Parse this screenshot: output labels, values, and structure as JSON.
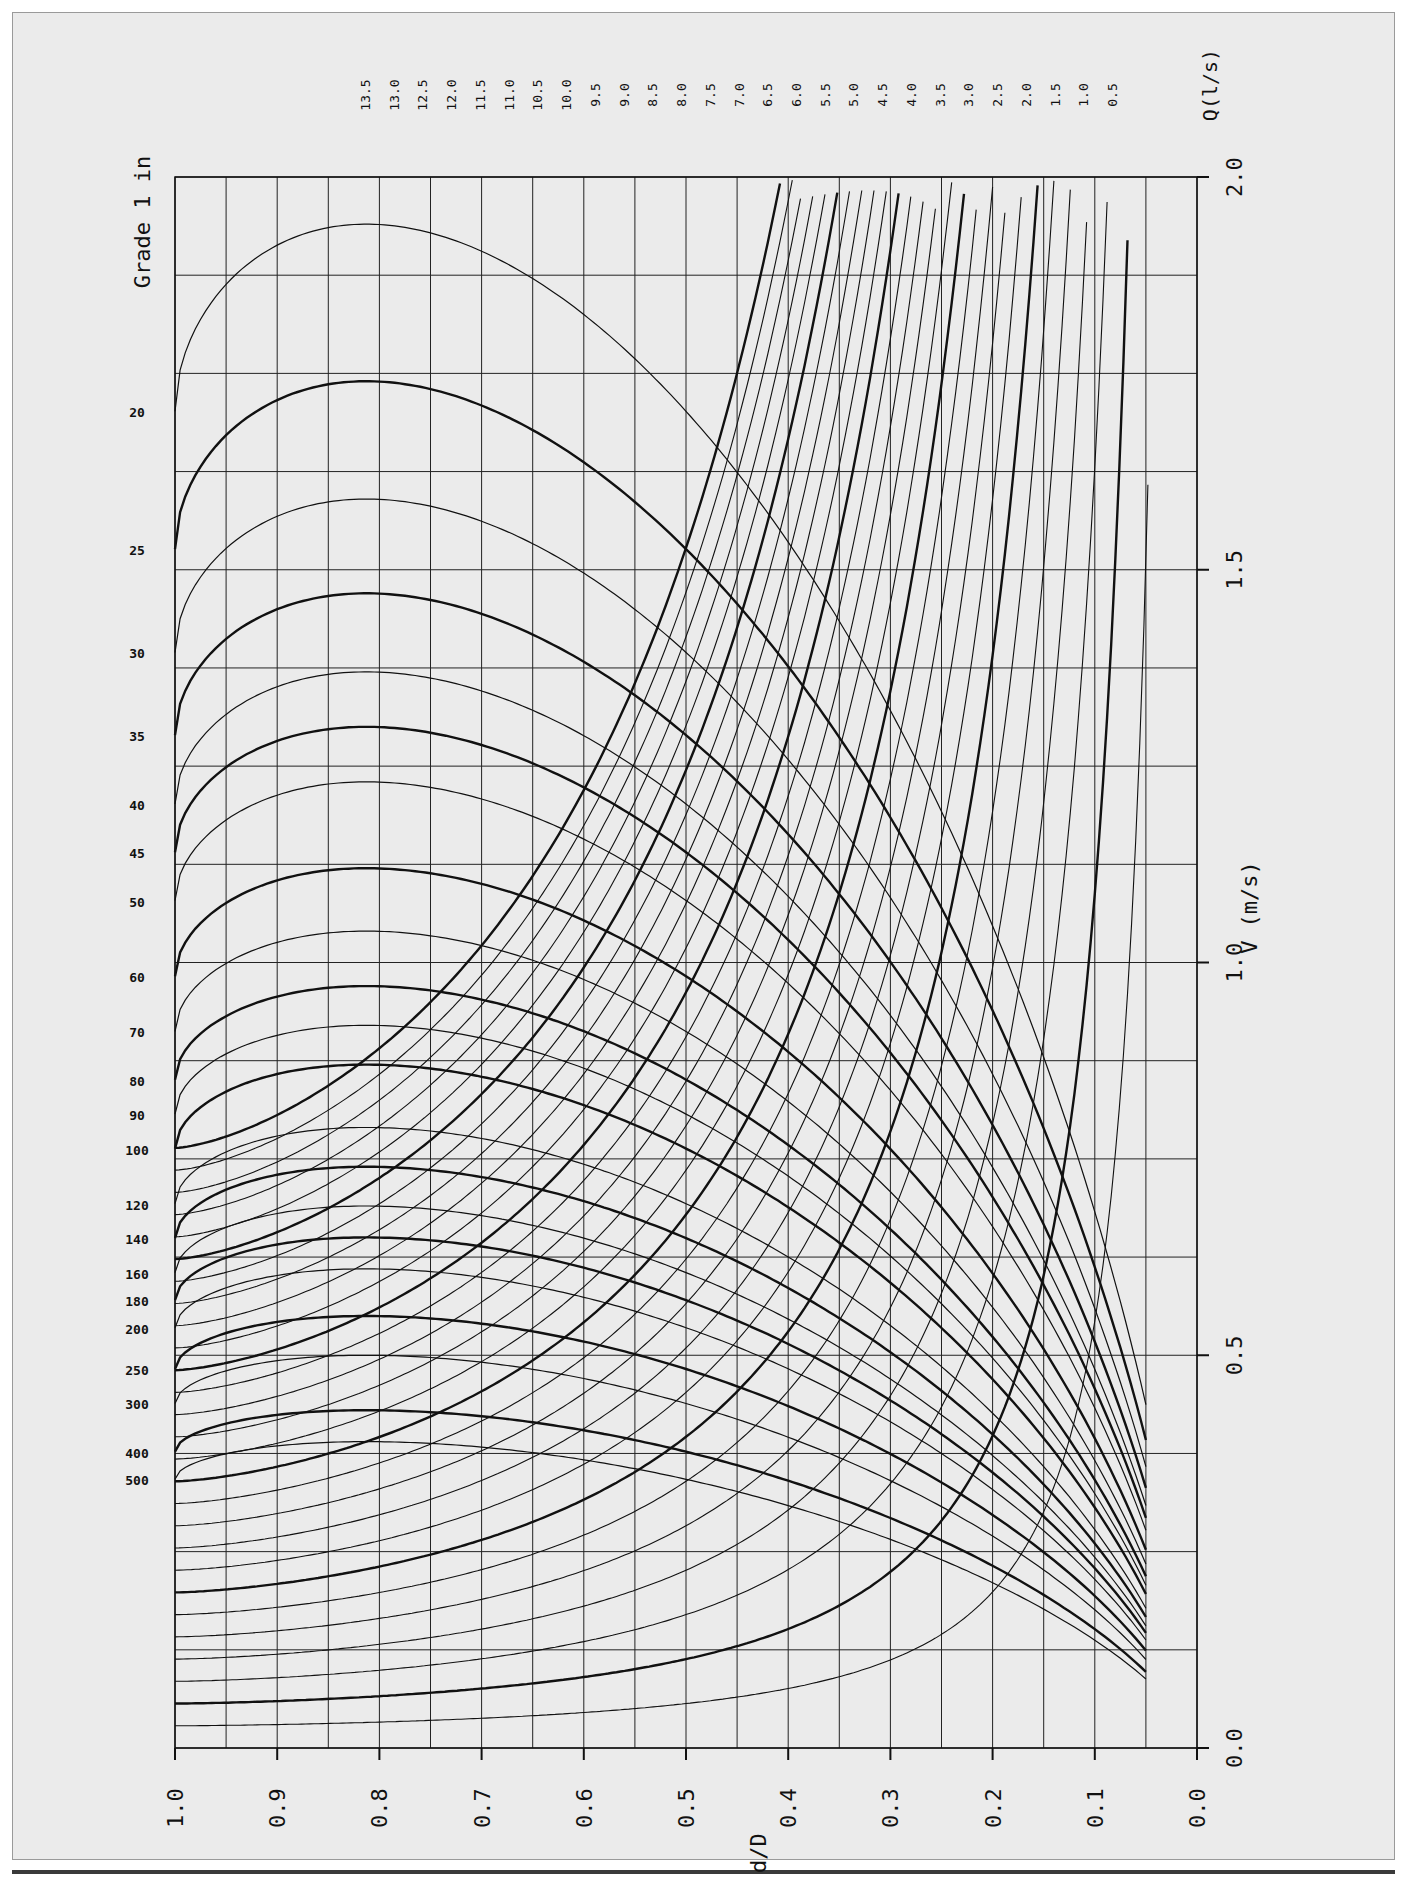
{
  "chart_data": {
    "type": "line",
    "orientation": "rotated: d/D axis runs along bottom (1.0 left → 0.0 right); V (m/s) axis runs along right side (2.0 top → 0.0 bottom)",
    "xlabel": "d/D",
    "ylabel": "V (m/s)",
    "xlim": [
      0.0,
      1.0
    ],
    "ylim": [
      0.0,
      2.0
    ],
    "x_ticks": [
      "1.0",
      "0.9",
      "0.8",
      "0.7",
      "0.6",
      "0.5",
      "0.4",
      "0.3",
      "0.2",
      "0.1",
      "0.0"
    ],
    "y_ticks": [
      "0.0",
      "0.5",
      "1.0",
      "1.5",
      "2.0"
    ],
    "grade_label": "Grade 1 in",
    "grade_values": [
      20,
      25,
      30,
      35,
      40,
      45,
      50,
      60,
      70,
      80,
      90,
      100,
      120,
      140,
      160,
      180,
      200,
      250,
      300,
      400,
      500
    ],
    "discharge_label": "Q(l/s)",
    "discharge_values": [
      13.5,
      13.0,
      12.5,
      12.0,
      11.5,
      11.0,
      10.5,
      10.0,
      9.5,
      9.0,
      8.5,
      8.0,
      7.5,
      7.0,
      6.5,
      6.0,
      5.5,
      5.0,
      4.5,
      4.0,
      3.5,
      3.0,
      2.5,
      2.0,
      1.5,
      1.0,
      0.5
    ],
    "grid": true,
    "series_note": "Grade curves: velocity vs d/D, peak near d/D≈0.81; discharge curves: constant-Q lines rising steeply as d/D decreases. Every 5th curve is drawn heavier.",
    "series": [
      {
        "name": "Grade 1 in 20",
        "peak_velocity": 1.94
      },
      {
        "name": "Grade 1 in 25",
        "peak_velocity": 1.74
      },
      {
        "name": "Grade 1 in 30",
        "peak_velocity": 1.59
      },
      {
        "name": "Grade 1 in 35",
        "peak_velocity": 1.47
      },
      {
        "name": "Grade 1 in 40",
        "peak_velocity": 1.37
      },
      {
        "name": "Grade 1 in 45",
        "peak_velocity": 1.3
      },
      {
        "name": "Grade 1 in 50",
        "peak_velocity": 1.23
      },
      {
        "name": "Grade 1 in 60",
        "peak_velocity": 1.12
      },
      {
        "name": "Grade 1 in 70",
        "peak_velocity": 1.04
      },
      {
        "name": "Grade 1 in 80",
        "peak_velocity": 0.97
      },
      {
        "name": "Grade 1 in 90",
        "peak_velocity": 0.92
      },
      {
        "name": "Grade 1 in 100",
        "peak_velocity": 0.87
      },
      {
        "name": "Grade 1 in 120",
        "peak_velocity": 0.79
      },
      {
        "name": "Grade 1 in 140",
        "peak_velocity": 0.74
      },
      {
        "name": "Grade 1 in 160",
        "peak_velocity": 0.69
      },
      {
        "name": "Grade 1 in 180",
        "peak_velocity": 0.65
      },
      {
        "name": "Grade 1 in 200",
        "peak_velocity": 0.61
      },
      {
        "name": "Grade 1 in 250",
        "peak_velocity": 0.55
      },
      {
        "name": "Grade 1 in 300",
        "peak_velocity": 0.5
      },
      {
        "name": "Grade 1 in 400",
        "peak_velocity": 0.43
      },
      {
        "name": "Grade 1 in 500",
        "peak_velocity": 0.39
      }
    ]
  }
}
